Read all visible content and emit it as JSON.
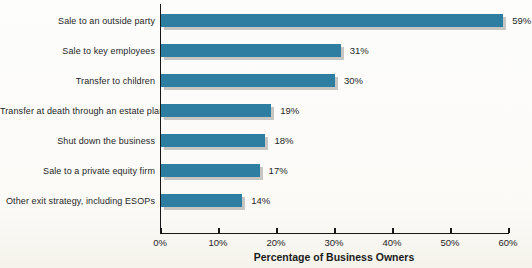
{
  "chart_data": {
    "type": "bar",
    "orientation": "horizontal",
    "title": "",
    "xlabel": "Percentage of Business Owners",
    "ylabel": "",
    "categories": [
      "Sale to an outside party",
      "Sale to key employees",
      "Transfer to children",
      "Transfer at death through an estate plan",
      "Shut down the business",
      "Sale to a private equity firm",
      "Other exit strategy, including ESOPs"
    ],
    "values": [
      59,
      31,
      30,
      19,
      18,
      17,
      14
    ],
    "value_labels": [
      "59%",
      "31%",
      "30%",
      "19%",
      "18%",
      "17%",
      "14%"
    ],
    "x_ticks": [
      "0%",
      "10%",
      "20%",
      "30%",
      "40%",
      "50%",
      "60%"
    ],
    "xlim": [
      0,
      60
    ],
    "grid": false,
    "legend": false,
    "bar_color": "#2e7ea1",
    "shadow_color": "#c7c6c2",
    "axis_color": "#181818"
  }
}
